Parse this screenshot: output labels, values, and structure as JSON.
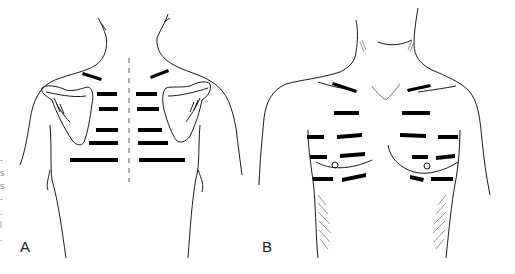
{
  "figure": {
    "panels": [
      {
        "id": "A",
        "label": "A",
        "view": "posterior thorax (back)"
      },
      {
        "id": "B",
        "label": "B",
        "view": "anterior thorax (chest)"
      }
    ],
    "margin_fragments": [
      "-",
      "s",
      "s",
      "-",
      ".",
      "l",
      "."
    ],
    "colors": {
      "line": "#1a1a1a",
      "marker": "#000000",
      "background": "#ffffff"
    }
  }
}
